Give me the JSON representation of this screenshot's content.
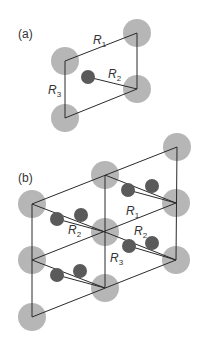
{
  "figure": {
    "panels": [
      {
        "id": "a",
        "label": "(a)",
        "vectors": [
          {
            "name": "R",
            "subscript": "1"
          },
          {
            "name": "R",
            "subscript": "2"
          },
          {
            "name": "R",
            "subscript": "3"
          }
        ]
      },
      {
        "id": "b",
        "label": "(b)",
        "vectors": [
          {
            "name": "R",
            "subscript": "1"
          },
          {
            "name": "R",
            "subscript": "2"
          },
          {
            "name": "R",
            "subscript": "2"
          },
          {
            "name": "R",
            "subscript": "3"
          }
        ]
      }
    ],
    "colors": {
      "large_atom": "#a9a9a9",
      "small_atom": "#5a5a5a",
      "lines": "#2a2a2a"
    }
  }
}
